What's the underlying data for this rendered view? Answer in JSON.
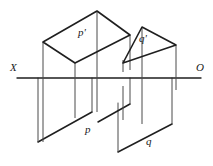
{
  "figure": {
    "kind": "descriptive-geometry-projection-diagram",
    "background_color": "#ffffff",
    "line_color": "#1f1f1f",
    "thin_line_color": "#4a4a4a",
    "labels": {
      "axis_left": "X",
      "axis_right": "O",
      "upper_left_plane": "p'",
      "upper_right_plane": "q'",
      "lower_left_plane": "p",
      "lower_right_plane": "q"
    },
    "axis": {
      "name": "ground-line",
      "y": 78,
      "x_start": 17,
      "x_end": 201
    },
    "geometry": {
      "p_prime_parallelogram": [
        [
          43,
          42
        ],
        [
          97,
          11
        ],
        [
          130,
          35
        ],
        [
          75,
          63
        ]
      ],
      "q_prime_triangle": [
        [
          142,
          27
        ],
        [
          176,
          45
        ],
        [
          123,
          63
        ]
      ],
      "p_parallelogram": [
        [
          38,
          142
        ],
        [
          92,
          112
        ],
        [
          125,
          88
        ],
        [
          71,
          118
        ]
      ],
      "q_parallelogram": [
        [
          118,
          152
        ],
        [
          172,
          124
        ],
        [
          172,
          90
        ],
        [
          118,
          118
        ]
      ],
      "verticals": [
        {
          "x": 43,
          "y1": 42,
          "y2": 142
        },
        {
          "x": 75,
          "y1": 63,
          "y2": 118
        },
        {
          "x": 97,
          "y1": 11,
          "y2": 112
        },
        {
          "x": 130,
          "y1": 35,
          "y2": 88
        },
        {
          "x": 123,
          "y1": 63,
          "y2": 118
        },
        {
          "x": 142,
          "y1": 27,
          "y2": 124
        },
        {
          "x": 176,
          "y1": 45,
          "y2": 90
        }
      ]
    }
  }
}
